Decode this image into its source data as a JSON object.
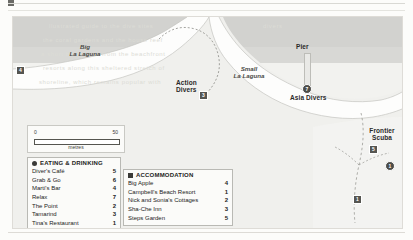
{
  "map": {
    "water_labels": [
      {
        "name": "Big La Laguna",
        "line1": "Big",
        "line2": "La Laguna"
      },
      {
        "name": "Small La Laguna",
        "line1": "Small",
        "line2": "La Laguna"
      }
    ],
    "place_labels": [
      {
        "name": "action-divers",
        "text": "Action\nDivers",
        "line1": "Action",
        "line2": "Divers"
      },
      {
        "name": "asia-divers",
        "text": "Asia Divers",
        "line1": "Asia Divers",
        "line2": ""
      },
      {
        "name": "pier",
        "text": "Pier",
        "line1": "Pier",
        "line2": ""
      },
      {
        "name": "frontier-scuba",
        "text": "Frontier Scuba",
        "line1": "Frontier",
        "line2": "Scuba"
      }
    ],
    "markers": [
      {
        "name": "marker-left-edge",
        "kind": "square",
        "label": "4"
      },
      {
        "name": "marker-action-divers-a",
        "kind": "square",
        "label": "2"
      },
      {
        "name": "marker-action-divers-b",
        "kind": "square",
        "label": "3"
      },
      {
        "name": "marker-asia-divers",
        "kind": "circle",
        "label": "7"
      },
      {
        "name": "marker-frontier-scuba-square",
        "kind": "square",
        "label": "5"
      },
      {
        "name": "marker-frontier-scuba-circle",
        "kind": "circle",
        "label": "1"
      },
      {
        "name": "marker-lower-right",
        "kind": "square",
        "label": "1"
      },
      {
        "name": "marker-small-lagoon-edge",
        "kind": "square",
        "label": "6"
      }
    ],
    "scale": {
      "start": "0",
      "end": "50",
      "unit": "metres"
    }
  },
  "legends": [
    {
      "name": "eating-and-drinking",
      "title": "EATING & DRINKING",
      "icon": "circle-marker-icon",
      "entries": [
        {
          "label": "Diver's Café",
          "number": "5"
        },
        {
          "label": "Grab & Go",
          "number": "6"
        },
        {
          "label": "Marti's Bar",
          "number": "4"
        },
        {
          "label": "Relax",
          "number": "7"
        },
        {
          "label": "The Point",
          "number": "2"
        },
        {
          "label": "Tamarind",
          "number": "3"
        },
        {
          "label": "Tina's Restaurant",
          "number": "1"
        }
      ]
    },
    {
      "name": "accommodation",
      "title": "ACCOMMODATION",
      "icon": "square-marker-icon",
      "entries": [
        {
          "label": "Big Apple",
          "number": "4"
        },
        {
          "label": "Campbell's Beach Resort",
          "number": "1"
        },
        {
          "label": "Nick and Sonia's Cottages",
          "number": "2"
        },
        {
          "label": "Sha-Che Inn",
          "number": "3"
        },
        {
          "label": "Steps Garden",
          "number": "5"
        }
      ]
    }
  ]
}
